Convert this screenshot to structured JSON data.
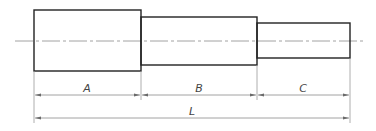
{
  "diagram": {
    "type": "stepped-shaft-dimension-drawing",
    "sections": [
      {
        "id": "A",
        "x1": 34,
        "x2": 141,
        "y1": 10,
        "y2": 71
      },
      {
        "id": "B",
        "x1": 141,
        "x2": 257,
        "y1": 17,
        "y2": 65
      },
      {
        "id": "C",
        "x1": 257,
        "x2": 350,
        "y1": 23,
        "y2": 58
      }
    ],
    "centerline": {
      "x1": 15,
      "x2": 365,
      "y": 41
    },
    "dimensions": {
      "segment_line_y": 95,
      "overall_line_y": 118,
      "labels": {
        "A": "A",
        "B": "B",
        "C": "C",
        "L": "L"
      }
    },
    "colors": {
      "outline": "#222222",
      "centerline": "#8a8a8a",
      "dimension": "#8a8a8a",
      "text": "#444444"
    }
  }
}
